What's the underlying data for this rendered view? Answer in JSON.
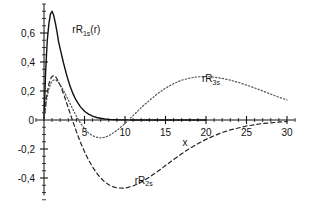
{
  "chart_data": {
    "type": "line",
    "title": "",
    "xlabel": "x",
    "ylabel": "",
    "xlim": [
      -1,
      31
    ],
    "ylim": [
      -0.52,
      0.8
    ],
    "grid": false,
    "legend_position": "inline-annotations",
    "xticks": [
      5,
      10,
      15,
      20,
      25,
      30
    ],
    "xticklabels": [
      "5",
      "10",
      "15",
      "20",
      "25",
      "30"
    ],
    "yticks": [
      0.6,
      0.4,
      0.2,
      0,
      -0.2,
      -0.4
    ],
    "yticklabels": [
      "0,6",
      "0,4",
      "0,2",
      "0",
      "-0,2",
      "-0,4"
    ],
    "minor_ticks": true,
    "annotations": [
      {
        "text": "rR1s(r)",
        "label_base": "rR",
        "label_sub": "1s",
        "label_tail": "(r)",
        "x": 3.5,
        "y": 0.6
      },
      {
        "text": "rR3s",
        "label_base": "rR",
        "label_sub": "3s",
        "label_tail": "",
        "x": 19.5,
        "y": 0.26
      },
      {
        "text": "rR2s",
        "label_base": "rR",
        "label_sub": "2s",
        "label_tail": "",
        "x": 11.2,
        "y": -0.44
      }
    ],
    "series": [
      {
        "name": "rR1s",
        "style": "solid",
        "color": "#111111",
        "x": [
          0.0,
          0.2,
          0.4,
          0.6,
          0.8,
          1.0,
          1.2,
          1.4,
          1.6,
          1.8,
          2.0,
          2.4,
          2.8,
          3.2,
          3.6,
          4.0,
          4.5,
          5.0,
          5.5,
          6.0,
          6.5,
          7.0,
          7.5,
          8.0,
          9.0,
          10.0,
          11.0,
          12.0,
          14.0,
          16.0,
          18.0,
          20.0
        ],
        "y": [
          0.0,
          0.368,
          0.603,
          0.732,
          0.808,
          0.828,
          0.795,
          0.74,
          0.672,
          0.596,
          0.541,
          0.436,
          0.342,
          0.261,
          0.197,
          0.147,
          0.1,
          0.067,
          0.045,
          0.03,
          0.019,
          0.013,
          0.008,
          0.005,
          0.002,
          0.001,
          0.0005,
          0.0002,
          0.0,
          0.0,
          0.0,
          0.0
        ]
      },
      {
        "name": "rR2s",
        "style": "dashed",
        "color": "#222222",
        "x": [
          0.0,
          0.3,
          0.6,
          0.9,
          1.2,
          1.5,
          1.8,
          2.0,
          2.2,
          2.5,
          3.0,
          3.5,
          4.0,
          4.5,
          5.0,
          5.5,
          6.0,
          6.5,
          7.0,
          7.5,
          8.0,
          8.5,
          9.0,
          10.0,
          11.0,
          12.0,
          13.0,
          14.0,
          15.0,
          16.0,
          17.0,
          17.5,
          18.0,
          19.0,
          20.0,
          21.0,
          22.0,
          23.0,
          25.0,
          27.0,
          30.0
        ],
        "y": [
          0.0,
          0.105,
          0.168,
          0.199,
          0.207,
          0.198,
          0.178,
          0.162,
          0.143,
          0.113,
          0.056,
          0.0,
          -0.054,
          -0.104,
          -0.147,
          -0.186,
          -0.219,
          -0.247,
          -0.27,
          -0.288,
          -0.301,
          -0.31,
          -0.316,
          -0.317,
          -0.307,
          -0.289,
          -0.266,
          -0.24,
          -0.212,
          -0.184,
          -0.157,
          -0.144,
          -0.132,
          -0.11,
          -0.09,
          -0.073,
          -0.058,
          -0.046,
          -0.028,
          -0.016,
          -0.007
        ]
      },
      {
        "name": "rR3s",
        "style": "dotted",
        "color": "#555555",
        "x": [
          0.0,
          0.3,
          0.6,
          0.9,
          1.2,
          1.5,
          1.8,
          2.0,
          2.3,
          2.6,
          3.0,
          3.5,
          4.0,
          4.5,
          5.0,
          5.5,
          6.0,
          6.5,
          7.0,
          7.5,
          8.0,
          9.0,
          10.0,
          11.0,
          12.0,
          12.5,
          13.0,
          14.0,
          15.0,
          16.0,
          17.0,
          18.0,
          19.0,
          20.0,
          21.0,
          22.0,
          23.0,
          24.0,
          25.0,
          26.0,
          27.0,
          28.0,
          29.0,
          30.0
        ],
        "y": [
          0.0,
          0.062,
          0.101,
          0.122,
          0.13,
          0.129,
          0.121,
          0.114,
          0.101,
          0.086,
          0.065,
          0.038,
          0.012,
          -0.01,
          -0.028,
          -0.042,
          -0.051,
          -0.056,
          -0.058,
          -0.056,
          -0.051,
          -0.034,
          -0.011,
          0.014,
          0.04,
          0.052,
          0.063,
          0.085,
          0.103,
          0.118,
          0.129,
          0.136,
          0.14,
          0.141,
          0.139,
          0.135,
          0.129,
          0.122,
          0.113,
          0.104,
          0.094,
          0.084,
          0.074,
          0.065
        ]
      }
    ],
    "notes": {
      "rendered_scale_note": "curves drawn scaled to match plotted pixel amplitudes",
      "peaks": {
        "rR1s_peak_value": 0.75,
        "rR1s_peak_x": 1.0,
        "rR2s_peak_value": 0.22,
        "rR2s_min_value": -0.47,
        "rR2s_min_x": 7.5,
        "rR3s_peak_value": 0.3,
        "rR3s_peak_x": 12.5,
        "rR3s_min_value": -0.19,
        "rR3s_min_x": 4.5
      }
    }
  }
}
